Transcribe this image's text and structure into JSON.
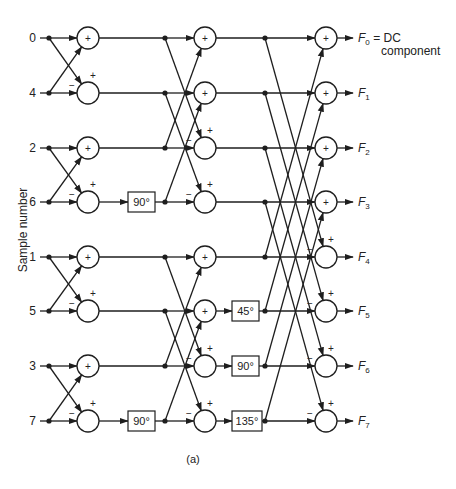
{
  "figure": {
    "caption": "(a)",
    "y_axis_label": "Sample number",
    "input_labels": [
      "0",
      "4",
      "2",
      "6",
      "1",
      "5",
      "3",
      "7"
    ],
    "output_labels": [
      {
        "sym": "F",
        "sub": "0",
        "suffix": " = DC",
        "suffix2": "component"
      },
      {
        "sym": "F",
        "sub": "1"
      },
      {
        "sym": "F",
        "sub": "2"
      },
      {
        "sym": "F",
        "sub": "3"
      },
      {
        "sym": "F",
        "sub": "4"
      },
      {
        "sym": "F",
        "sub": "5"
      },
      {
        "sym": "F",
        "sub": "6"
      },
      {
        "sym": "F",
        "sub": "7"
      }
    ],
    "stages": [
      {
        "name": "stage-1",
        "span": 1,
        "twiddles": []
      },
      {
        "name": "stage-2",
        "span": 2,
        "twiddles": [
          {
            "row": 3,
            "label": "90°"
          },
          {
            "row": 7,
            "label": "90°"
          }
        ]
      },
      {
        "name": "stage-3",
        "span": 4,
        "twiddles": [
          {
            "row": 5,
            "label": "45°"
          },
          {
            "row": 6,
            "label": "90°"
          },
          {
            "row": 7,
            "label": "135°"
          }
        ]
      }
    ],
    "summer_signs": {
      "plus": "+",
      "minus": "−"
    },
    "colors": {
      "ink": "#1e1e1e",
      "background": "#ffffff"
    }
  }
}
